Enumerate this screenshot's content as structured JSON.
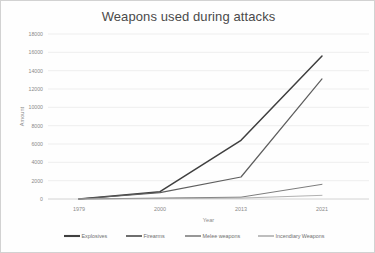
{
  "chart_data": {
    "type": "line",
    "title": "Weapons used during attacks",
    "xlabel": "Year",
    "ylabel": "Amount",
    "categories": [
      "1979",
      "2000",
      "2013",
      "2021"
    ],
    "x": [
      1979,
      2000,
      2013,
      2021
    ],
    "ylim": [
      0,
      18000
    ],
    "ytick_labels": [
      "0",
      "2000",
      "4000",
      "6000",
      "8000",
      "10000",
      "12000",
      "14000",
      "16000",
      "18000"
    ],
    "ytick_values": [
      0,
      2000,
      4000,
      6000,
      8000,
      10000,
      12000,
      14000,
      16000,
      18000
    ],
    "grid": "horizontal",
    "legend_position": "bottom",
    "series": [
      {
        "name": "Explosives",
        "values": [
          0,
          800,
          6400,
          15600
        ],
        "color": "#3f3f3f",
        "width": 1.5
      },
      {
        "name": "Firearms",
        "values": [
          0,
          700,
          2400,
          13100
        ],
        "color": "#5e5e5e",
        "width": 1.2
      },
      {
        "name": "Melee weapons",
        "values": [
          0,
          100,
          200,
          1600
        ],
        "color": "#7d7d7d",
        "width": 1.0
      },
      {
        "name": "Incendiary Weapons",
        "values": [
          0,
          50,
          100,
          400
        ],
        "color": "#a8a8a8",
        "width": 0.9
      }
    ]
  }
}
